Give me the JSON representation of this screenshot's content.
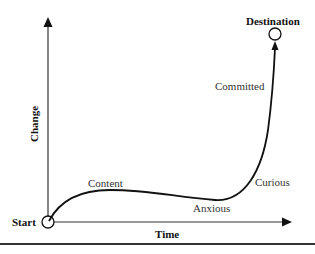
{
  "diagram": {
    "axes": {
      "x_label": "Time",
      "y_label": "Change"
    },
    "endpoints": {
      "start": "Start",
      "end": "Destination"
    },
    "stages": [
      {
        "label": "Content"
      },
      {
        "label": "Anxious"
      },
      {
        "label": "Curious"
      },
      {
        "label": "Committed"
      }
    ],
    "colors": {
      "line": "#111111",
      "text": "#333333"
    }
  }
}
